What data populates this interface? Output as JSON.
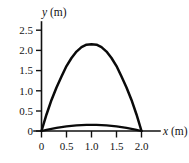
{
  "chart_data": {
    "type": "line",
    "title": "",
    "subtitle": "",
    "xlabel": "x (m)",
    "ylabel": "y (m)",
    "xlabel_var": "x",
    "xlabel_unit": "(m)",
    "ylabel_var": "y",
    "ylabel_unit": "(m)",
    "xlim": [
      0,
      2.0
    ],
    "ylim": [
      0,
      2.5
    ],
    "grid": false,
    "legend": null,
    "x_ticks": [
      0,
      0.5,
      1.0,
      1.5,
      2.0
    ],
    "x_tick_labels": [
      "0",
      "0.5",
      "1.0",
      "1.5",
      "2.0"
    ],
    "y_ticks": [
      0,
      0.5,
      1.0,
      1.5,
      2.0,
      2.5
    ],
    "y_tick_labels": [
      "0",
      "0.5",
      "1.0",
      "1.5",
      "2.0",
      "2.5"
    ],
    "series": [
      {
        "name": "high-trajectory",
        "color": "#0a0a0a",
        "peak_x": 1.0,
        "peak_y": 2.15,
        "x_start": 0.0,
        "x_end": 2.0,
        "x": [
          0.0,
          0.1,
          0.2,
          0.3,
          0.4,
          0.5,
          0.6,
          0.7,
          0.8,
          0.9,
          1.0,
          1.1,
          1.2,
          1.3,
          1.4,
          1.5,
          1.6,
          1.7,
          1.8,
          1.9,
          2.0
        ],
        "values": [
          0.0,
          0.41,
          0.77,
          1.08,
          1.35,
          1.61,
          1.81,
          1.97,
          2.08,
          2.14,
          2.15,
          2.14,
          2.08,
          1.97,
          1.81,
          1.61,
          1.35,
          1.08,
          0.77,
          0.41,
          0.0
        ]
      },
      {
        "name": "low-trajectory",
        "color": "#0a0a0a",
        "peak_x": 1.0,
        "peak_y": 0.15,
        "x_start": 0.0,
        "x_end": 2.0,
        "x": [
          0.0,
          0.1,
          0.2,
          0.3,
          0.4,
          0.5,
          0.6,
          0.7,
          0.8,
          0.9,
          1.0,
          1.1,
          1.2,
          1.3,
          1.4,
          1.5,
          1.6,
          1.7,
          1.8,
          1.9,
          2.0
        ],
        "values": [
          0.0,
          0.029,
          0.054,
          0.076,
          0.095,
          0.113,
          0.127,
          0.138,
          0.146,
          0.15,
          0.15,
          0.15,
          0.146,
          0.138,
          0.127,
          0.113,
          0.095,
          0.076,
          0.054,
          0.029,
          0.0
        ]
      }
    ]
  },
  "labels": {
    "y_axis_name_var": "y",
    "y_axis_name_unit": " (m)",
    "x_axis_name_var": "x",
    "x_axis_name_unit": " (m)",
    "y_2_5": "2.5",
    "y_2_0": "2.0",
    "y_1_5": "1.5",
    "y_1_0": "1.0",
    "y_0_5": "0.5",
    "y_0": "0",
    "x_0": "0",
    "x_0_5": "0.5",
    "x_1_0": "1.0",
    "x_1_5": "1.5",
    "x_2_0": "2.0"
  },
  "colors": {
    "background": "#ffffff",
    "ink": "#111111",
    "curve": "#0a0a0a"
  }
}
